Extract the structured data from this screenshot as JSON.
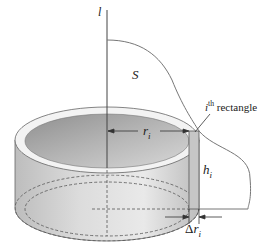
{
  "diagram": {
    "type": "shell-method-cylindrical-shell",
    "labels": {
      "axis": "l",
      "region": "S",
      "rectangle_sup": "i",
      "rectangle_suffix": "th",
      "rectangle_word": "rectangle",
      "radius_base": "r",
      "radius_sub": "i",
      "height_base": "h",
      "height_sub": "i",
      "thickness_delta": "Δ",
      "thickness_base": "r",
      "thickness_sub": "i"
    },
    "colors": {
      "outline": "#555555",
      "curve": "#777777",
      "shell_outer_light": "#e8e8e8",
      "shell_outer_dark": "#b8b8b8",
      "shell_inner_dark": "#9a9a9a",
      "rim": "#f2f2f2",
      "rectangle_fill": "#c8c8c8"
    }
  }
}
